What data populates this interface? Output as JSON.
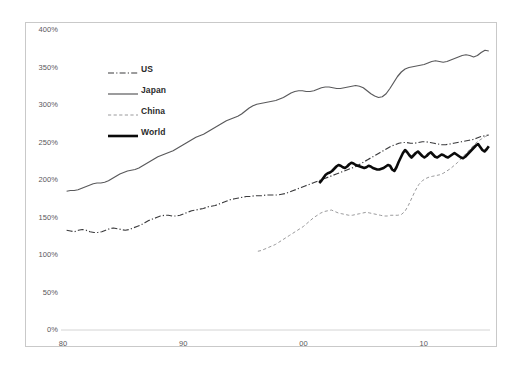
{
  "chart_data": {
    "type": "line",
    "title": "",
    "xlabel": "",
    "ylabel": "",
    "ylim": [
      0,
      400
    ],
    "xlim": [
      1980,
      2015.5
    ],
    "yticks": [
      "0%",
      "50%",
      "100%",
      "150%",
      "200%",
      "250%",
      "300%",
      "350%",
      "400%"
    ],
    "ytick_values": [
      0,
      50,
      100,
      150,
      200,
      250,
      300,
      350,
      400
    ],
    "xticks": [
      "80",
      "90",
      "00",
      "10"
    ],
    "xtick_values": [
      1980,
      1990,
      2000,
      2010
    ],
    "grid": false,
    "legend_position": "upper-left-inside",
    "unit": "percent",
    "series": [
      {
        "name": "US",
        "style": "dash-dot",
        "color": "#3a3a3c",
        "width": 1.2,
        "x_start": 1980.3,
        "x_end": 2015.4,
        "values": [
          133,
          132,
          131,
          133,
          134,
          133,
          131,
          130,
          130,
          131,
          133,
          135,
          136,
          135,
          134,
          133,
          134,
          136,
          138,
          140,
          143,
          146,
          148,
          150,
          152,
          153,
          153,
          152,
          152,
          153,
          155,
          157,
          159,
          160,
          161,
          162,
          164,
          165,
          166,
          168,
          170,
          172,
          174,
          175,
          176,
          177,
          178,
          178,
          179,
          179,
          179,
          180,
          180,
          180,
          180,
          181,
          182,
          184,
          186,
          188,
          190,
          192,
          194,
          196,
          198,
          200,
          202,
          204,
          206,
          208,
          210,
          212,
          214,
          216,
          218,
          221,
          224,
          227,
          230,
          233,
          236,
          239,
          242,
          245,
          247,
          249,
          250,
          250,
          249,
          249,
          250,
          251,
          251,
          250,
          249,
          248,
          247,
          247,
          248,
          249,
          250,
          251,
          252,
          253,
          254,
          256,
          258,
          259,
          260
        ]
      },
      {
        "name": "Japan",
        "style": "solid-thin",
        "color": "#5a5a5c",
        "width": 1.2,
        "x_start": 1980.3,
        "x_end": 2015.4,
        "values": [
          185,
          186,
          186,
          187,
          189,
          191,
          193,
          195,
          196,
          196,
          197,
          199,
          202,
          205,
          208,
          210,
          212,
          213,
          214,
          216,
          219,
          222,
          225,
          228,
          231,
          233,
          235,
          237,
          239,
          242,
          245,
          248,
          251,
          254,
          257,
          259,
          261,
          264,
          267,
          270,
          273,
          276,
          279,
          281,
          283,
          285,
          288,
          292,
          296,
          299,
          301,
          302,
          303,
          304,
          305,
          306,
          308,
          310,
          313,
          316,
          318,
          319,
          319,
          318,
          318,
          319,
          321,
          323,
          324,
          324,
          323,
          322,
          322,
          323,
          324,
          325,
          326,
          325,
          323,
          319,
          315,
          312,
          310,
          311,
          315,
          322,
          330,
          338,
          344,
          348,
          350,
          351,
          352,
          353,
          354,
          356,
          358,
          359,
          358,
          357,
          358,
          360,
          362,
          364,
          366,
          367,
          366,
          364,
          366,
          370,
          373,
          372
        ]
      },
      {
        "name": "China",
        "style": "dashed-light",
        "color": "#9a9a9c",
        "width": 1.0,
        "x_start": 1996.2,
        "x_end": 2015.4,
        "values": [
          105,
          106,
          108,
          110,
          112,
          114,
          117,
          120,
          123,
          126,
          129,
          132,
          135,
          138,
          142,
          146,
          150,
          153,
          156,
          158,
          159,
          160,
          158,
          156,
          155,
          154,
          153,
          153,
          154,
          155,
          156,
          157,
          156,
          155,
          154,
          153,
          152,
          152,
          153,
          153,
          153,
          154,
          158,
          166,
          176,
          186,
          194,
          199,
          202,
          204,
          205,
          206,
          207,
          209,
          212,
          215,
          219,
          223,
          228,
          233,
          238,
          243,
          248,
          252,
          255,
          258,
          260
        ]
      },
      {
        "name": "World",
        "style": "solid-thick",
        "color": "#0a0a0a",
        "width": 2.6,
        "x_start": 2001.3,
        "x_end": 2015.4,
        "values": [
          196,
          199,
          203,
          207,
          209,
          210,
          212,
          215,
          218,
          220,
          219,
          217,
          216,
          218,
          221,
          223,
          222,
          220,
          219,
          218,
          217,
          216,
          217,
          219,
          218,
          216,
          215,
          214,
          214,
          215,
          216,
          218,
          220,
          219,
          214,
          212,
          217,
          224,
          230,
          236,
          240,
          237,
          233,
          230,
          233,
          236,
          238,
          235,
          232,
          230,
          232,
          235,
          237,
          234,
          231,
          230,
          232,
          234,
          233,
          231,
          230,
          232,
          234,
          236,
          234,
          232,
          230,
          229,
          231,
          234,
          237,
          240,
          243,
          246,
          248,
          244,
          240,
          238,
          241,
          245
        ]
      }
    ]
  },
  "legend": {
    "items": [
      {
        "label": "US",
        "style": "dash-dot"
      },
      {
        "label": "Japan",
        "style": "solid-thin"
      },
      {
        "label": "China",
        "style": "dashed-light"
      },
      {
        "label": "World",
        "style": "solid-thick"
      }
    ]
  },
  "colors": {
    "frame_border": "#c9c9c9",
    "axis_line": "#d4d4d4",
    "tick_text": "#59585b",
    "background": "#ffffff"
  }
}
